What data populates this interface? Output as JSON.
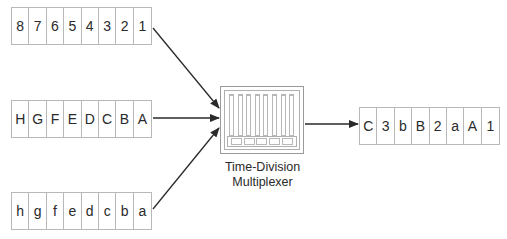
{
  "diagram": {
    "inputs": [
      {
        "id": "numbers",
        "cells": [
          "8",
          "7",
          "6",
          "5",
          "4",
          "3",
          "2",
          "1"
        ]
      },
      {
        "id": "uppercase",
        "cells": [
          "H",
          "G",
          "F",
          "E",
          "D",
          "C",
          "B",
          "A"
        ]
      },
      {
        "id": "lowercase",
        "cells": [
          "h",
          "g",
          "f",
          "e",
          "d",
          "c",
          "b",
          "a"
        ]
      }
    ],
    "multiplexer": {
      "label_line1": "Time-Division",
      "label_line2": "Multiplexer",
      "slots": 8,
      "tray_cells": 5
    },
    "output": {
      "cells": [
        "C",
        "3",
        "b",
        "B",
        "2",
        "a",
        "A",
        "1"
      ]
    },
    "colors": {
      "line": "#2a2a2a",
      "cell_border": "#b8b8b8",
      "text": "#2a2a2a"
    }
  }
}
